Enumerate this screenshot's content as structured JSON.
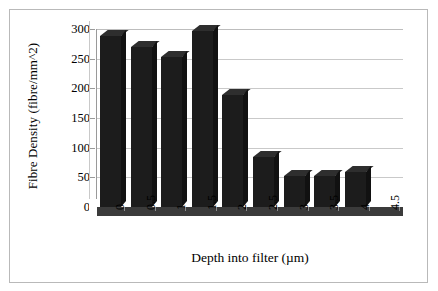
{
  "chart_data": {
    "type": "bar",
    "title": "",
    "xlabel": "Depth into filter (µm)",
    "ylabel": "Fibre Density (fibre/mm^2)",
    "categories": [
      "0",
      "0.5",
      "1",
      "1.5",
      "2",
      "2.5",
      "3",
      "3.5",
      "4",
      "4.5"
    ],
    "values": [
      288,
      270,
      252,
      296,
      188,
      85,
      53,
      53,
      59,
      0
    ],
    "ylim": [
      0,
      300
    ],
    "yticks": [
      0,
      50,
      100,
      150,
      200,
      250,
      300
    ],
    "ytick_labels": [
      "0",
      "50",
      "100",
      "150",
      "200",
      "250",
      "300"
    ],
    "grid": true,
    "legend": false,
    "legend_position": "none",
    "style": "3d-column",
    "bar_color": "#1c1c1c",
    "gridline_color": "#c9c9c9",
    "background_color": "#ffffff",
    "frame_color": "#b9b9b9"
  }
}
